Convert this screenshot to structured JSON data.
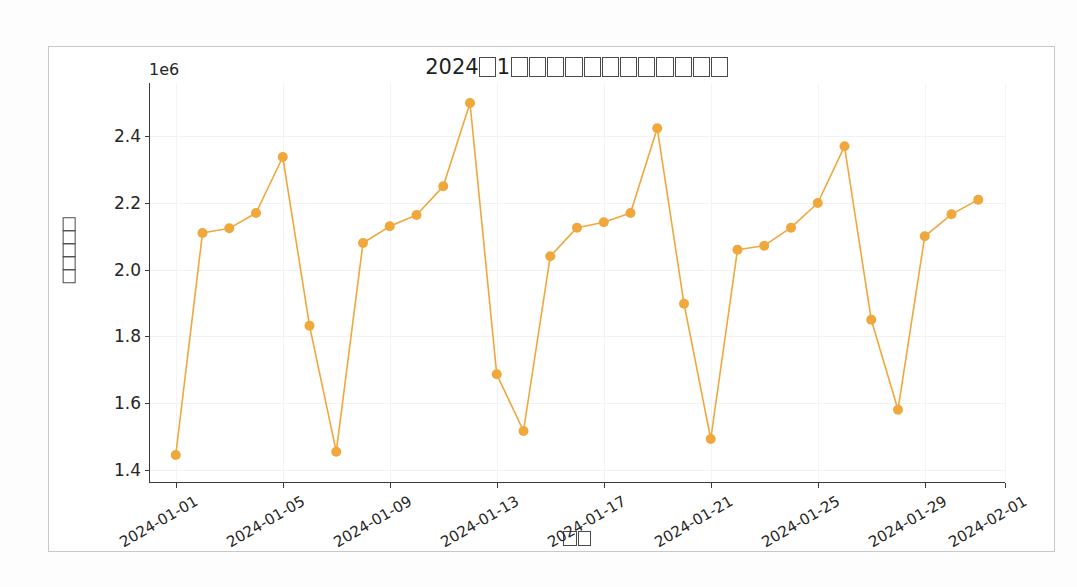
{
  "figure": {
    "title_prefix": "2024",
    "title_year_unit_boxes": 1,
    "title_month": "1",
    "title_trailing_boxes": 12,
    "title_full_text": "2024□1□□□□□□□□□□□□□",
    "offset_text": "1e6",
    "background_color": "#ffffff",
    "frame_color": "#c8c8c8"
  },
  "chart_data": {
    "type": "line",
    "title": "2024□1□□□□□□□□□□□□□",
    "xlabel": "□□",
    "ylabel": "□□□□□",
    "xlabel_box_count": 2,
    "ylabel_box_count": 5,
    "series_color": "#f0a73c",
    "marker": "circle",
    "marker_size": 5,
    "line_width": 1.6,
    "grid": true,
    "legend": null,
    "y_offset_multiplier": 1000000,
    "ylim": [
      1360000,
      2560000
    ],
    "yticks": [
      1400000,
      1600000,
      1800000,
      2000000,
      2200000,
      2400000
    ],
    "ytick_labels": [
      "1.4",
      "1.6",
      "1.8",
      "2.0",
      "2.2",
      "2.4"
    ],
    "xlim": [
      "2023-12-31",
      "2024-02-01"
    ],
    "xticks": [
      "2024-01-01",
      "2024-01-05",
      "2024-01-09",
      "2024-01-13",
      "2024-01-17",
      "2024-01-21",
      "2024-01-25",
      "2024-01-29",
      "2024-02-01"
    ],
    "xtick_labels": [
      "2024-01-01",
      "2024-01-05",
      "2024-01-09",
      "2024-01-13",
      "2024-01-17",
      "2024-01-21",
      "2024-01-25",
      "2024-01-29",
      "2024-02-01"
    ],
    "x": [
      "2024-01-01",
      "2024-01-02",
      "2024-01-03",
      "2024-01-04",
      "2024-01-05",
      "2024-01-06",
      "2024-01-07",
      "2024-01-08",
      "2024-01-09",
      "2024-01-10",
      "2024-01-11",
      "2024-01-12",
      "2024-01-13",
      "2024-01-14",
      "2024-01-15",
      "2024-01-16",
      "2024-01-17",
      "2024-01-18",
      "2024-01-19",
      "2024-01-20",
      "2024-01-21",
      "2024-01-22",
      "2024-01-23",
      "2024-01-24",
      "2024-01-25",
      "2024-01-26",
      "2024-01-27",
      "2024-01-28",
      "2024-01-29",
      "2024-01-30",
      "2024-01-31"
    ],
    "values": [
      1444000,
      2110000,
      2124000,
      2170000,
      2338000,
      1832000,
      1454000,
      2080000,
      2130000,
      2164000,
      2250000,
      2500000,
      1686000,
      1516000,
      2040000,
      2126000,
      2142000,
      2170000,
      2424000,
      1898000,
      1492000,
      2060000,
      2072000,
      2126000,
      2200000,
      2370000,
      1850000,
      1580000,
      2100000,
      2166000,
      2210000
    ]
  }
}
